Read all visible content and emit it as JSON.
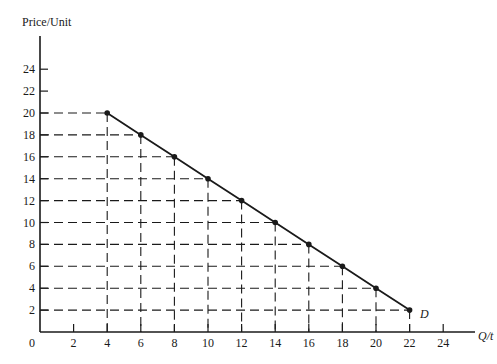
{
  "chart_data": {
    "type": "line",
    "title": "",
    "xlabel": "Q/t",
    "ylabel": "Price/Unit",
    "curve_label": "D",
    "x_ticks": [
      0,
      2,
      4,
      6,
      8,
      10,
      12,
      14,
      16,
      18,
      20,
      22,
      24
    ],
    "y_ticks": [
      2,
      4,
      6,
      8,
      10,
      12,
      14,
      16,
      18,
      20,
      22,
      24
    ],
    "xlim": [
      0,
      26
    ],
    "ylim": [
      0,
      27
    ],
    "grid": "dashed projection lines from each point to both axes",
    "series": [
      {
        "name": "D",
        "x": [
          4,
          6,
          8,
          10,
          12,
          14,
          16,
          18,
          20,
          22
        ],
        "y": [
          20,
          18,
          16,
          14,
          12,
          10,
          8,
          6,
          4,
          2
        ]
      }
    ]
  },
  "colors": {
    "ink": "#1a1a1a",
    "background": "#ffffff"
  }
}
